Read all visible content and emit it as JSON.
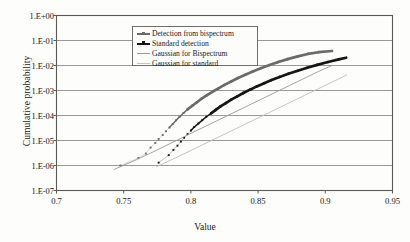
{
  "chart_data": {
    "type": "line",
    "title": "",
    "xlabel": "Value",
    "ylabel": "Cumulative probability",
    "xlim": [
      0.7,
      0.95
    ],
    "ylim": [
      1e-07,
      1
    ],
    "yscale": "log",
    "xscale": "linear",
    "grid": "horizontal",
    "xticks": [
      "0.7",
      "0.75",
      "0.8",
      "0.85",
      "0.9",
      "0.95"
    ],
    "xtick_values": [
      0.7,
      0.75,
      0.8,
      0.85,
      0.9,
      0.95
    ],
    "yticks": [
      "1.E+00",
      "1.E-01",
      "1.E-02",
      "1.E-03",
      "1.E-04",
      "1.E-05",
      "1.E-06",
      "1.E-07"
    ],
    "ytick_values": [
      1,
      0.1,
      0.01,
      0.001,
      0.0001,
      1e-05,
      1e-06,
      1e-07
    ],
    "legend_position": "upper-center",
    "series": [
      {
        "name": "Detection from bispectrum",
        "style": "markers-line",
        "color": "#6b6b6b",
        "points": [
          [
            0.7475,
            1e-06
          ],
          [
            0.761,
            2e-06
          ],
          [
            0.7665,
            3e-06
          ],
          [
            0.77,
            5.2e-06
          ],
          [
            0.7735,
            8e-06
          ],
          [
            0.776,
            1.15e-05
          ],
          [
            0.779,
            1.65e-05
          ],
          [
            0.7815,
            2.35e-05
          ],
          [
            0.784,
            3.3e-05
          ],
          [
            0.7865,
            4.6e-05
          ],
          [
            0.789,
            6.4e-05
          ],
          [
            0.7915,
            8.8e-05
          ],
          [
            0.7945,
            0.000125
          ],
          [
            0.7975,
            0.000175
          ],
          [
            0.801,
            0.000245
          ],
          [
            0.8045,
            0.00034
          ],
          [
            0.808,
            0.00047
          ],
          [
            0.812,
            0.00065
          ],
          [
            0.816,
            0.00089
          ],
          [
            0.8205,
            0.00122
          ],
          [
            0.825,
            0.00168
          ],
          [
            0.83,
            0.0023
          ],
          [
            0.835,
            0.00315
          ],
          [
            0.8405,
            0.0043
          ],
          [
            0.846,
            0.0058
          ],
          [
            0.852,
            0.0078
          ],
          [
            0.8585,
            0.0104
          ],
          [
            0.865,
            0.0138
          ],
          [
            0.872,
            0.018
          ],
          [
            0.8795,
            0.0232
          ],
          [
            0.887,
            0.029
          ],
          [
            0.895,
            0.034
          ],
          [
            0.905,
            0.038
          ]
        ]
      },
      {
        "name": "Standard detection",
        "style": "markers-line",
        "color": "#151515",
        "points": [
          [
            0.776,
            1.3e-06
          ],
          [
            0.7835,
            2.6e-06
          ],
          [
            0.787,
            4.2e-06
          ],
          [
            0.79,
            6.2e-06
          ],
          [
            0.7925,
            9e-06
          ],
          [
            0.795,
            1.28e-05
          ],
          [
            0.7975,
            1.8e-05
          ],
          [
            0.8,
            2.5e-05
          ],
          [
            0.8025,
            3.45e-05
          ],
          [
            0.8055,
            4.75e-05
          ],
          [
            0.8085,
            6.5e-05
          ],
          [
            0.8115,
            8.9e-05
          ],
          [
            0.815,
            0.000122
          ],
          [
            0.8185,
            0.000168
          ],
          [
            0.822,
            0.00023
          ],
          [
            0.826,
            0.000315
          ],
          [
            0.83,
            0.00043
          ],
          [
            0.8345,
            0.000585
          ],
          [
            0.839,
            0.000795
          ],
          [
            0.844,
            0.00108
          ],
          [
            0.849,
            0.00146
          ],
          [
            0.8545,
            0.00196
          ],
          [
            0.86,
            0.00262
          ],
          [
            0.866,
            0.0035
          ],
          [
            0.8725,
            0.00465
          ],
          [
            0.8795,
            0.00615
          ],
          [
            0.8865,
            0.0081
          ],
          [
            0.894,
            0.0106
          ],
          [
            0.902,
            0.0138
          ],
          [
            0.91,
            0.0175
          ],
          [
            0.9155,
            0.0205
          ]
        ]
      },
      {
        "name": "Gaussian for Bispectrum",
        "style": "line",
        "color": "#9a9a9a",
        "points": [
          [
            0.743,
            7e-07
          ],
          [
            0.76,
            1.75e-06
          ],
          [
            0.775,
            4.2e-06
          ],
          [
            0.79,
            1.05e-05
          ],
          [
            0.805,
            2.6e-05
          ],
          [
            0.82,
            6.4e-05
          ],
          [
            0.835,
            0.000158
          ],
          [
            0.85,
            0.00039
          ],
          [
            0.865,
            0.00096
          ],
          [
            0.88,
            0.00236
          ],
          [
            0.895,
            0.0058
          ],
          [
            0.905,
            0.01
          ]
        ]
      },
      {
        "name": "Gaussian for standard",
        "style": "line",
        "color": "#bdbdbd",
        "points": [
          [
            0.7745,
            9e-07
          ],
          [
            0.79,
            2.2e-06
          ],
          [
            0.805,
            5.4e-06
          ],
          [
            0.82,
            1.32e-05
          ],
          [
            0.835,
            3.25e-05
          ],
          [
            0.85,
            8e-05
          ],
          [
            0.865,
            0.000197
          ],
          [
            0.88,
            0.000484
          ],
          [
            0.895,
            0.00119
          ],
          [
            0.91,
            0.00292
          ],
          [
            0.916,
            0.0042
          ]
        ]
      }
    ]
  },
  "axes": {
    "ylabel": "Cumulative probability",
    "xlabel": "Value"
  },
  "legend": {
    "items": [
      {
        "label": "Detection from bispectrum",
        "color": "#6b6b6b",
        "marker": true
      },
      {
        "label": "Standard detection",
        "color": "#151515",
        "marker": true
      },
      {
        "label": "Gaussian for Bispectrum",
        "color": "#9a9a9a",
        "marker": false
      },
      {
        "label": "Gaussian for standard",
        "color": "#c4c4c4",
        "marker": false
      }
    ]
  },
  "colors": {
    "frame": "#5a5a5a",
    "grid": "#8d8d8d",
    "background": "#fdfdfb",
    "text": "#141414"
  }
}
